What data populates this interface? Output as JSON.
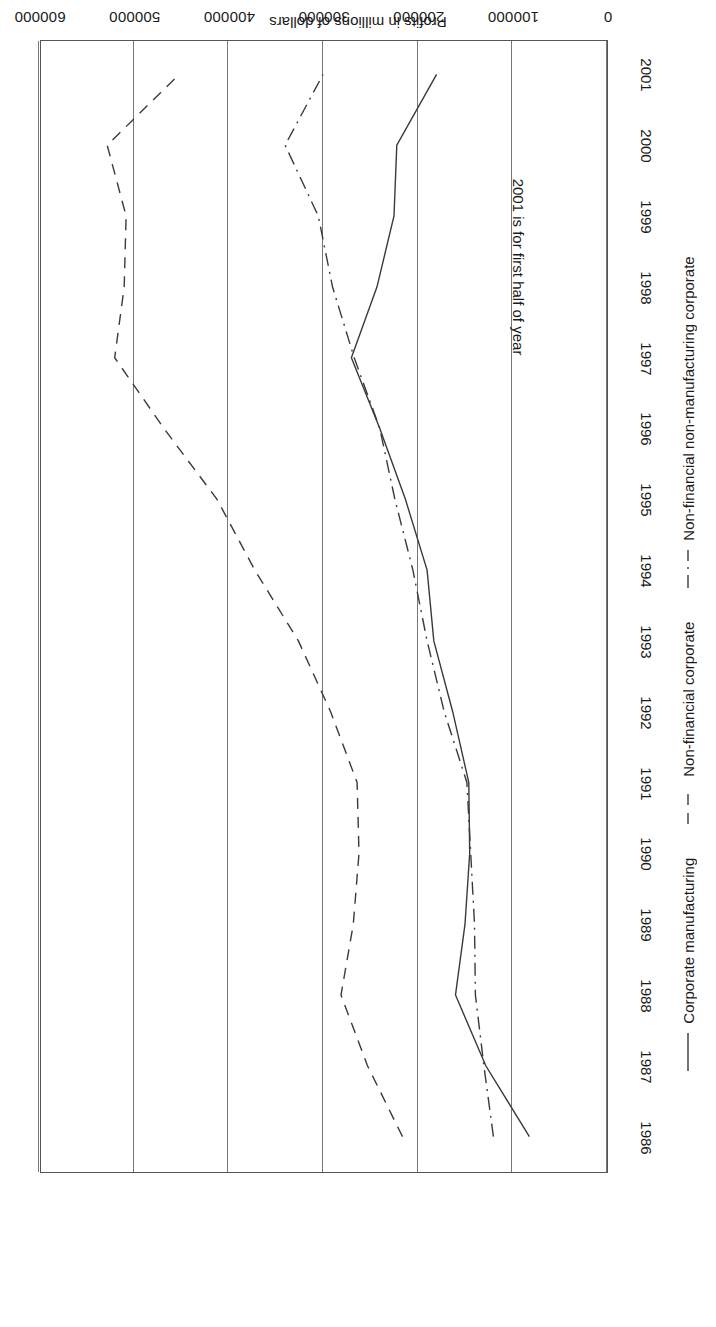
{
  "chart_data": {
    "type": "line",
    "title": "",
    "xlabel": "",
    "ylabel": "Profits in millions of dollars",
    "orientation": "page-rotated-180",
    "x": [
      1986,
      1987,
      1988,
      1989,
      1990,
      1991,
      1992,
      1993,
      1994,
      1995,
      1996,
      1997,
      1998,
      1999,
      2000,
      2001
    ],
    "xtick_labels": [
      "1986",
      "1987",
      "1988",
      "1989",
      "1990",
      "1991",
      "1992",
      "1993",
      "1994",
      "1995",
      "1996",
      "1997",
      "1998",
      "1999",
      "2000",
      "2001"
    ],
    "ytick_labels": [
      "600000",
      "500000",
      "400000",
      "300000",
      "200000",
      "100000",
      "0"
    ],
    "ytick_values": [
      600000,
      500000,
      400000,
      300000,
      200000,
      100000,
      0
    ],
    "ylim": [
      0,
      600000
    ],
    "xlim": [
      1986,
      2001
    ],
    "grid": true,
    "grid_axis": "value",
    "legend_position": "bottom",
    "annotations": [
      {
        "text": "2001 is for first half of year",
        "x": 1998.3,
        "y": 95000
      }
    ],
    "series": [
      {
        "name": "Corporate manufacturing",
        "style": "solid",
        "color": "#3a3a3a",
        "values": [
          82000,
          128000,
          160000,
          150000,
          145000,
          146000,
          163000,
          183000,
          190000,
          213000,
          240000,
          270000,
          243000,
          225000,
          222000,
          180000
        ]
      },
      {
        "name": "Non-financial corporate",
        "style": "dashed",
        "color": "#3a3a3a",
        "values": [
          216000,
          253000,
          281000,
          268000,
          262000,
          264000,
          292000,
          326000,
          372000,
          412000,
          468000,
          520000,
          510000,
          508000,
          528000,
          452000
        ]
      },
      {
        "name": "Non-financial non-manufacturing corporate",
        "style": "dashdot",
        "color": "#3a3a3a",
        "values": [
          120000,
          130000,
          139000,
          140000,
          144000,
          148000,
          172000,
          190000,
          205000,
          224000,
          240000,
          267000,
          290000,
          305000,
          340000,
          300000
        ]
      }
    ]
  },
  "axis": {
    "value_axis_title": "Profits in millions of dollars"
  },
  "legend": {
    "items": [
      {
        "label": "Corporate manufacturing",
        "style": "solid"
      },
      {
        "label": "Non-financial corporate",
        "style": "dashed"
      },
      {
        "label": "Non-financial non-manufacturing corporate",
        "style": "dashdot"
      }
    ]
  }
}
